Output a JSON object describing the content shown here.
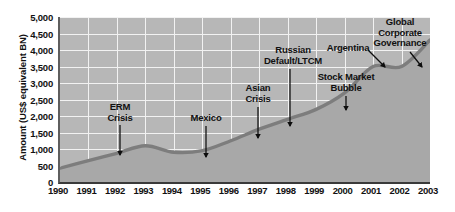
{
  "chart_data": {
    "type": "area",
    "title": "",
    "subtitle": "",
    "xlabel": "",
    "ylabel": "Amount (US$ equivalent BN)",
    "grid": true,
    "legend": "none",
    "xlim": [
      1990,
      2003
    ],
    "ylim": [
      0,
      5000
    ],
    "ytick_step": 500,
    "categories": [
      "1990",
      "1991",
      "1992",
      "1993",
      "1994",
      "1995",
      "1996",
      "1997",
      "1998",
      "1999",
      "2000",
      "2001",
      "2002",
      "2003"
    ],
    "x": [
      1990,
      1991,
      1992,
      1993,
      1994,
      1995,
      1996,
      1997,
      1998,
      1999,
      2000,
      2001,
      2002,
      2003
    ],
    "values": [
      420,
      650,
      870,
      1100,
      900,
      950,
      1250,
      1600,
      1900,
      2200,
      2700,
      3500,
      3500,
      4300
    ],
    "series": [
      {
        "name": "Amount outstanding",
        "values": [
          420,
          650,
          870,
          1100,
          900,
          950,
          1250,
          1600,
          1900,
          2200,
          2700,
          3500,
          3500,
          4300
        ]
      }
    ],
    "ytick_labels": [
      "5,000",
      "4,500",
      "4,000",
      "3,500",
      "3,000",
      "2,500",
      "2,000",
      "1,500",
      "1,000",
      "500",
      "0"
    ],
    "ytick_values": [
      5000,
      4500,
      4000,
      3500,
      3000,
      2500,
      2000,
      1500,
      1000,
      500,
      0
    ],
    "colors": {
      "plot_background": "#b7b7b7",
      "gridline": "#f2f2f2",
      "series_line": "#7d7d7d",
      "area_fill": "#a8a8a8",
      "axis": "#3a3a3a",
      "text": "#111111"
    },
    "annotations": [
      {
        "id": "erm-crisis",
        "text": "ERM\nCrisis",
        "label_x": 120,
        "label_y": 102,
        "arrow_from_x": 120,
        "arrow_from_y": 125,
        "arrow_to_x": 120,
        "arrow_to_y": 155,
        "year": 1992,
        "value": 870
      },
      {
        "id": "mexico",
        "text": "Mexico",
        "label_x": 206,
        "label_y": 113,
        "arrow_from_x": 206,
        "arrow_from_y": 126,
        "arrow_to_x": 206,
        "arrow_to_y": 157,
        "year": 1995,
        "value": 950
      },
      {
        "id": "asian-crisis",
        "text": "Asian\nCrisis",
        "label_x": 258,
        "label_y": 83,
        "arrow_from_x": 258,
        "arrow_from_y": 107,
        "arrow_to_x": 258,
        "arrow_to_y": 138,
        "year": 1997,
        "value": 1600
      },
      {
        "id": "russian-default",
        "text": "Russian\nDefault/LTCM",
        "label_x": 293,
        "label_y": 45,
        "arrow_from_x": 290,
        "arrow_from_y": 69,
        "arrow_to_x": 290,
        "arrow_to_y": 126,
        "year": 1998,
        "value": 1900
      },
      {
        "id": "stock-market-bubble",
        "text": "Stock Market\nBubble",
        "label_x": 346,
        "label_y": 72,
        "arrow_from_x": 346,
        "arrow_from_y": 96,
        "arrow_to_x": 346,
        "arrow_to_y": 110,
        "year": 2000,
        "value": 2700
      },
      {
        "id": "argentina",
        "text": "Argentina",
        "label_x": 348,
        "label_y": 43,
        "arrow_from_x": 368,
        "arrow_from_y": 50,
        "arrow_to_x": 385,
        "arrow_to_y": 67,
        "year": 2001,
        "value": 3500
      },
      {
        "id": "global-corporate-governance",
        "text": "Global\nCorporate\nGovernance",
        "label_x": 400,
        "label_y": 17,
        "arrow_from_x": 410,
        "arrow_from_y": 52,
        "arrow_to_x": 422,
        "arrow_to_y": 67,
        "year": 2002,
        "value": 3500
      }
    ]
  }
}
